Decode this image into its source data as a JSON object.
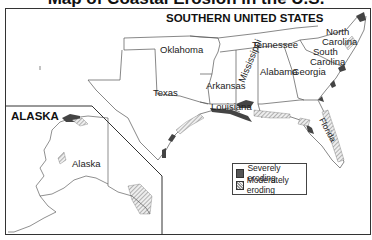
{
  "title_partial": "Map of Coastal Erosion in the U.S.",
  "main_map": {
    "title": "SOUTHERN UNITED STATES",
    "states": [
      {
        "name": "Oklahoma"
      },
      {
        "name": "Arkansas"
      },
      {
        "name": "Tennessee"
      },
      {
        "name": "North Carolina",
        "line1": "North",
        "line2": "Carolina"
      },
      {
        "name": "South Carolina",
        "line1": "South",
        "line2": "Carolina"
      },
      {
        "name": "Mississippi"
      },
      {
        "name": "Alabama"
      },
      {
        "name": "Georgia"
      },
      {
        "name": "Texas"
      },
      {
        "name": "Louisiana"
      },
      {
        "name": "Florida"
      }
    ]
  },
  "inset": {
    "title": "ALASKA",
    "label": "Alaska"
  },
  "legend": {
    "items": [
      {
        "label": "Severely eroding",
        "color": "#555555"
      },
      {
        "label": "Moderately eroding",
        "pattern": "hatched"
      }
    ]
  }
}
